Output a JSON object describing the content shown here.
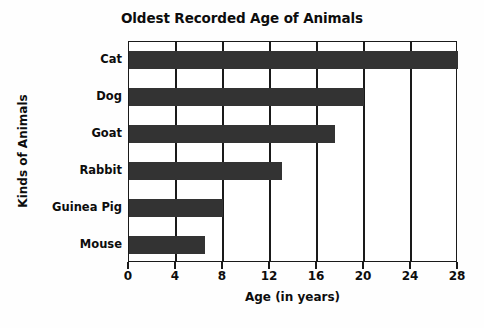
{
  "chart_data": {
    "type": "bar",
    "orientation": "horizontal",
    "title": "Oldest Recorded Age of Animals",
    "xlabel": "Age (in years)",
    "ylabel": "Kinds of Animals",
    "categories": [
      "Cat",
      "Dog",
      "Goat",
      "Rabbit",
      "Guinea Pig",
      "Mouse"
    ],
    "values": [
      28,
      20,
      17.5,
      13,
      8,
      6.5
    ],
    "xticks": [
      0,
      4,
      8,
      12,
      16,
      20,
      24,
      28
    ],
    "xtick_labels": [
      "0",
      "4",
      "8",
      "12",
      "16",
      "20",
      "24",
      "28"
    ],
    "xlim": [
      0,
      28
    ],
    "grid": "vertical",
    "legend": "none",
    "bar_color": "#333333",
    "axis_color": "#1a1a1a",
    "background_color": "#ffffff",
    "text_color": "#0d0d0d"
  }
}
